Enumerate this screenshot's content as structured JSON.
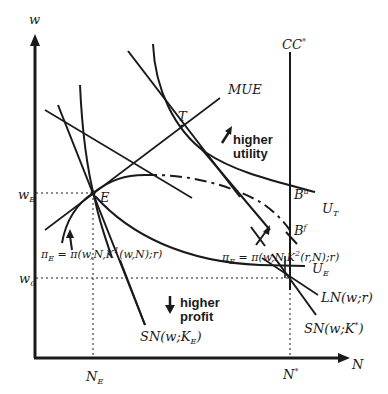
{
  "figure": {
    "type": "economic diagram",
    "axes": {
      "y_label": "w",
      "x_label": "N",
      "y_ticks": [
        {
          "main": "w",
          "sub": "E"
        },
        {
          "main": "w",
          "sub": "0"
        }
      ],
      "x_ticks": [
        {
          "main": "N",
          "sub": "E"
        },
        {
          "main": "N",
          "sup": "*"
        }
      ]
    },
    "points": {
      "E": "E",
      "T": "T",
      "Bu": {
        "main": "B",
        "sup": "u"
      },
      "Bf": {
        "main": "B",
        "sup": "f"
      }
    },
    "curves": {
      "cc": {
        "main": "CC",
        "sup": "*"
      },
      "mue": "MUE",
      "ut": {
        "main": "U",
        "sub": "T"
      },
      "ue": {
        "main": "U",
        "sub": "E"
      },
      "ln": "LN(w;r)",
      "sn_star": {
        "pre": "SN(w;K",
        "sup": "*",
        "post": ")"
      },
      "sn_e": {
        "pre": "SN(w;K",
        "sub": "E",
        "post": ")"
      },
      "iso1": {
        "pre_main": "π",
        "pre_sub": "E",
        "mid": " = π(w,N,K",
        "sup": "1",
        "post": "(w,N);r)"
      },
      "iso2": {
        "pre_main": "π",
        "pre_sub": "E",
        "mid": " = π(w,N,K",
        "sup": "2",
        "post": "(r,N);r)"
      }
    },
    "annotations": {
      "utility_line1": "higher",
      "utility_line2": "utility",
      "profit_line1": "higher",
      "profit_line2": "profit"
    },
    "colors": {
      "ink": "#1a1a1a",
      "background": "#ffffff"
    }
  }
}
